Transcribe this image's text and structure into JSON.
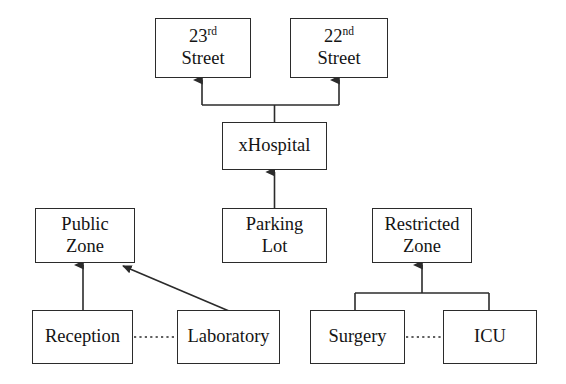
{
  "diagram": {
    "background_color": "#ffffff",
    "line_color": "#2b2b2b",
    "text_color": "#141414",
    "nodes": [
      {
        "id": "street23",
        "name": "street-23rd",
        "line1_num": "23",
        "line1_ord": "rd",
        "line2": "Street",
        "x": 155,
        "y": 18,
        "w": 96,
        "h": 60
      },
      {
        "id": "street22",
        "name": "street-22nd",
        "line1_num": "22",
        "line1_ord": "nd",
        "line2": "Street",
        "x": 290,
        "y": 18,
        "w": 98,
        "h": 60
      },
      {
        "id": "hospital",
        "name": "x-hospital",
        "line1": "xHospital",
        "x": 222,
        "y": 122,
        "w": 105,
        "h": 48
      },
      {
        "id": "publiczone",
        "name": "public-zone",
        "line1": "Public",
        "line2": "Zone",
        "x": 35,
        "y": 208,
        "w": 100,
        "h": 55
      },
      {
        "id": "parkinglot",
        "name": "parking-lot",
        "line1": "Parking",
        "line2": "Lot",
        "x": 222,
        "y": 208,
        "w": 105,
        "h": 55
      },
      {
        "id": "restrictedzone",
        "name": "restricted-zone",
        "line1": "Restricted",
        "line2": "Zone",
        "x": 372,
        "y": 208,
        "w": 100,
        "h": 55
      },
      {
        "id": "reception",
        "name": "reception",
        "line1": "Reception",
        "x": 32,
        "y": 310,
        "w": 101,
        "h": 54
      },
      {
        "id": "laboratory",
        "name": "laboratory",
        "line1": "Laboratory",
        "x": 177,
        "y": 310,
        "w": 103,
        "h": 54
      },
      {
        "id": "surgery",
        "name": "surgery",
        "line1": "Surgery",
        "x": 310,
        "y": 310,
        "w": 95,
        "h": 54
      },
      {
        "id": "icu",
        "name": "icu",
        "line1": "ICU",
        "x": 443,
        "y": 310,
        "w": 94,
        "h": 54
      }
    ],
    "edges": [
      {
        "name": "edge-hospital-to-streets",
        "from": "hospital",
        "to": "street23 / street22",
        "style": "solid",
        "arrow": "both-branches"
      },
      {
        "name": "edge-parkinglot-to-hospital",
        "from": "parkinglot",
        "to": "hospital",
        "style": "solid",
        "arrow": "single"
      },
      {
        "name": "edge-reception-to-publiczone",
        "from": "reception",
        "to": "publiczone",
        "style": "solid",
        "arrow": "single"
      },
      {
        "name": "edge-laboratory-to-publiczone",
        "from": "laboratory",
        "to": "publiczone",
        "style": "solid",
        "arrow": "single-diagonal"
      },
      {
        "name": "edge-surgery-icu-to-restrictedzone",
        "from": "surgery / icu",
        "to": "restrictedzone",
        "style": "solid",
        "arrow": "merged-branches"
      },
      {
        "name": "edge-reception-laboratory",
        "from": "reception",
        "to": "laboratory",
        "style": "dotted",
        "arrow": "none"
      },
      {
        "name": "edge-surgery-icu",
        "from": "surgery",
        "to": "icu",
        "style": "dotted",
        "arrow": "none"
      }
    ]
  }
}
